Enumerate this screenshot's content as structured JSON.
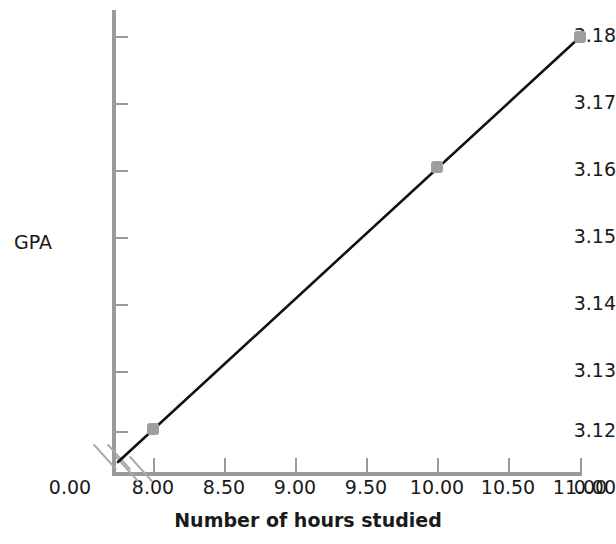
{
  "chart_data": {
    "type": "line",
    "title": "",
    "xlabel": "Number of hours studied",
    "ylabel": "GPA",
    "x": [
      8.0,
      10.0,
      11.0
    ],
    "values": [
      3.12,
      3.16,
      3.18
    ],
    "series": [
      {
        "name": "GPA",
        "x": [
          8.0,
          10.0,
          11.0
        ],
        "values": [
          3.12,
          3.16,
          3.18
        ]
      }
    ],
    "xlim": [
      8.0,
      11.0
    ],
    "ylim": [
      3.12,
      3.18
    ],
    "x_tick_labels": [
      "0.00",
      "8.00",
      "8.50",
      "9.00",
      "9.50",
      "10.00",
      "10.50",
      "11.00"
    ],
    "y_tick_labels": [
      "3.18",
      "3.17",
      "3.16",
      "3.15",
      "3.14",
      "3.13",
      "3.12",
      "0.00"
    ],
    "grid": false,
    "legend": "none",
    "axis_break_x": true,
    "axis_break_y": true,
    "line_color": "#111111",
    "marker_color": "#9e9e9e",
    "axis_color": "#9a9a9a",
    "background": "#ffffff",
    "marker": "square"
  },
  "ticks": {
    "y": [
      {
        "label": "3.18",
        "top": 26
      },
      {
        "label": "3.17",
        "top": 93
      },
      {
        "label": "3.16",
        "top": 160
      },
      {
        "label": "3.15",
        "top": 227
      },
      {
        "label": "3.14",
        "top": 294
      },
      {
        "label": "3.13",
        "top": 361
      },
      {
        "label": "3.12",
        "top": 421
      }
    ],
    "y_break": {
      "label": "0.00",
      "top": 478
    },
    "x": [
      {
        "label": "8.00",
        "left": 153
      },
      {
        "label": "8.50",
        "left": 224
      },
      {
        "label": "9.00",
        "left": 295
      },
      {
        "label": "9.50",
        "left": 366
      },
      {
        "label": "10.00",
        "left": 437
      },
      {
        "label": "10.50",
        "left": 508
      },
      {
        "label": "11.00",
        "left": 580
      }
    ],
    "x_break": {
      "label": "0.00",
      "left": 70
    }
  },
  "points": [
    {
      "name": "point-8-312",
      "cx": 153,
      "cy": 429,
      "x": "8.00",
      "y": "3.12"
    },
    {
      "name": "point-10-316",
      "cx": 437,
      "cy": 167,
      "x": "10.00",
      "y": "3.16"
    },
    {
      "name": "point-11-318",
      "cx": 580,
      "cy": 37,
      "x": "11.00",
      "y": "3.18"
    }
  ],
  "line": {
    "start_x": 118,
    "start_y": 462,
    "end_x": 580,
    "end_y": 37
  }
}
